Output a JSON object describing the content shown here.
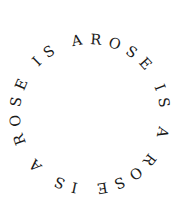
{
  "artwork": {
    "type": "circular-text",
    "text": "ROSE IS A ROSE IS A ROSE IS A ",
    "phrase": "ROSE IS A",
    "repetitions": 3,
    "direction": "clockwise",
    "start_word": "ROSE",
    "start_position": "top",
    "colors": {
      "background": "#ffffff",
      "text": "#1a1a1a"
    }
  }
}
